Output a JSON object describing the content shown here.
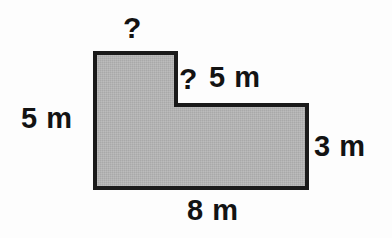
{
  "figure": {
    "shape_name": "l-shaped-polygon",
    "fill_color": "#b3b3b3",
    "stroke_color": "#1a1a1a",
    "background_color": "#fdfdfd",
    "stroke_width": 4,
    "vertices": [
      [
        95,
        53
      ],
      [
        176,
        53
      ],
      [
        176,
        105
      ],
      [
        307,
        105
      ],
      [
        307,
        188
      ],
      [
        95,
        188
      ]
    ]
  },
  "labels": {
    "top_unknown": "?",
    "inner_unknown": "?",
    "top_right_dimension": "5 m",
    "left_dimension": "5 m",
    "right_dimension": "3 m",
    "bottom_dimension": "8 m"
  },
  "chart_data": {
    "type": "diagram",
    "title": "",
    "subtitle": "",
    "shape": "L-shape (composite rectangle)",
    "unit": "m",
    "known_dimensions": [
      {
        "edge": "left",
        "label": "5 m",
        "value": 5,
        "orientation": "vertical"
      },
      {
        "edge": "top-right-horizontal",
        "label": "5 m",
        "value": 5,
        "orientation": "horizontal"
      },
      {
        "edge": "right",
        "label": "3 m",
        "value": 3,
        "orientation": "vertical"
      },
      {
        "edge": "bottom",
        "label": "8 m",
        "value": 8,
        "orientation": "horizontal"
      }
    ],
    "unknown_dimensions": [
      {
        "edge": "top",
        "label": "?",
        "orientation": "horizontal"
      },
      {
        "edge": "inner-vertical",
        "label": "?",
        "orientation": "vertical"
      }
    ]
  }
}
